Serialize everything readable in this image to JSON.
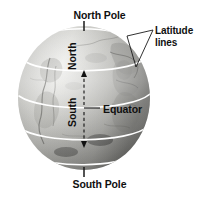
{
  "diagram": {
    "background_color": "#ffffff",
    "labels": {
      "north_pole": "North Pole",
      "south_pole": "South Pole",
      "latitude_lines_1": "Latitude",
      "latitude_lines_2": "lines",
      "equator": "Equator",
      "north": "North",
      "south": "South"
    },
    "colors": {
      "label_text": "#101010",
      "latitude_line": "#ffffff",
      "leader_line": "#1a1a1a",
      "axis_arrow": "#111111",
      "globe_highlight": "#e9e9e7",
      "globe_midtone": "#b9b9b6",
      "globe_shadow": "#8f8f8c",
      "globe_edge": "#7c7c79"
    },
    "globe": {
      "center_x": 84,
      "center_y": 98,
      "radius_x": 66,
      "radius_y": 72
    },
    "latitude_lines": [
      {
        "name": "arctic-circle",
        "y": 39
      },
      {
        "name": "tropic-of-cancer",
        "y": 70
      },
      {
        "name": "equator",
        "y": 110
      },
      {
        "name": "tropic-of-capricorn",
        "y": 145
      }
    ]
  }
}
